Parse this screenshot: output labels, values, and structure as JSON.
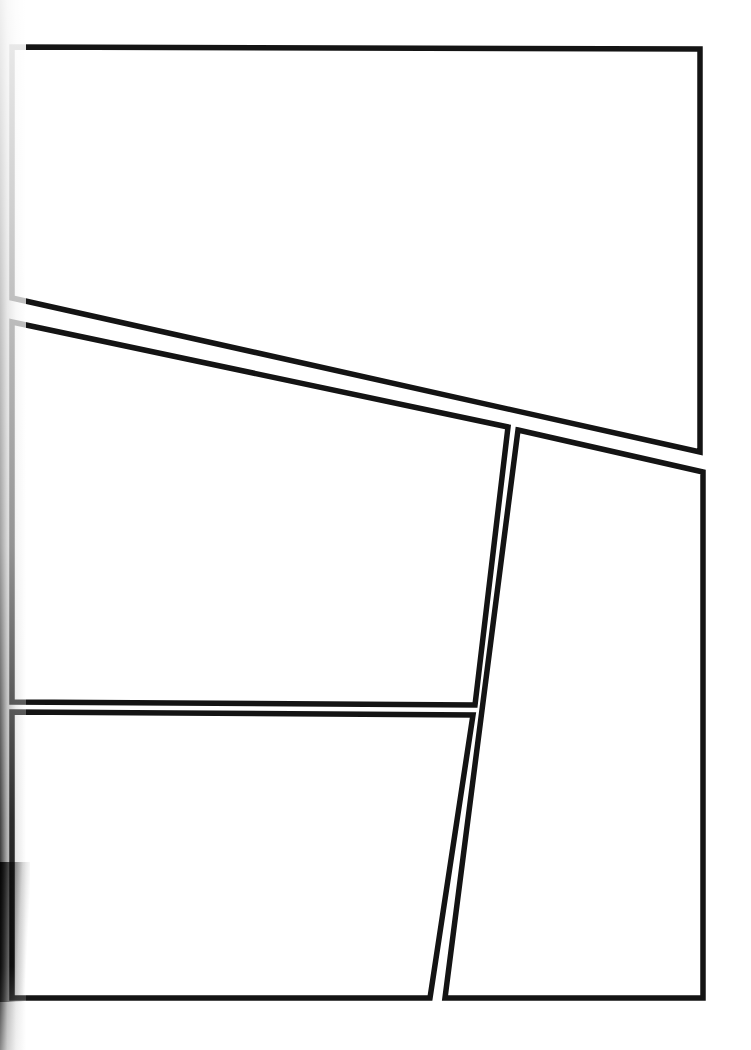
{
  "page": {
    "width": 751,
    "height": 1050,
    "background_color": "#ffffff",
    "ink_color": "#141414",
    "border_width_px": 5.5,
    "gutter_width_px": 9,
    "panel_count": 4,
    "content_note": "All panels are empty — no artwork, text, lettering or balloons are drawn."
  },
  "scan_artifacts": {
    "left_edge_shadow": {
      "name": "left-edge-scan-shadow",
      "description": "Dark vertical gradient band along the left margin, darkest toward the lower-left corner",
      "color": "#000000",
      "x": 0,
      "y": 0,
      "width": 26,
      "height": 1050
    },
    "lower_left_blotch": {
      "name": "lower-left-scan-blotch",
      "description": "Heavier black smudge near the bottom-left corner of the scan",
      "color": "#000000",
      "x": 0,
      "y": 820,
      "width": 34,
      "height": 230
    }
  },
  "panels": [
    {
      "id": "panel-1",
      "label": "Panel 1",
      "position": "top full-width",
      "shape": "quadrilateral",
      "fill": "#ffffff",
      "stroke": "#141414",
      "empty": true,
      "points": "12,47 700,49 700,452 12,298",
      "corners": [
        {
          "name": "top-left",
          "x": 12,
          "y": 47
        },
        {
          "name": "top-right",
          "x": 700,
          "y": 49
        },
        {
          "name": "bottom-right",
          "x": 700,
          "y": 452
        },
        {
          "name": "bottom-left",
          "x": 12,
          "y": 298
        }
      ]
    },
    {
      "id": "panel-2",
      "label": "Panel 2",
      "position": "middle left",
      "shape": "quadrilateral",
      "fill": "#ffffff",
      "stroke": "#141414",
      "empty": true,
      "points": "12,322 508,427 475,705 12,702",
      "corners": [
        {
          "name": "top-left",
          "x": 12,
          "y": 322
        },
        {
          "name": "top-right",
          "x": 508,
          "y": 427
        },
        {
          "name": "bottom-right",
          "x": 475,
          "y": 705
        },
        {
          "name": "bottom-left",
          "x": 12,
          "y": 702
        }
      ]
    },
    {
      "id": "panel-3",
      "label": "Panel 3",
      "position": "right tall",
      "shape": "quadrilateral",
      "fill": "#ffffff",
      "stroke": "#141414",
      "empty": true,
      "points": "518,430 703,472 703,998 445,998",
      "corners": [
        {
          "name": "top-left",
          "x": 518,
          "y": 430
        },
        {
          "name": "top-right",
          "x": 703,
          "y": 472
        },
        {
          "name": "bottom-right",
          "x": 703,
          "y": 998
        },
        {
          "name": "bottom-left",
          "x": 445,
          "y": 998
        }
      ]
    },
    {
      "id": "panel-4",
      "label": "Panel 4",
      "position": "bottom left",
      "shape": "quadrilateral",
      "fill": "#ffffff",
      "stroke": "#141414",
      "empty": true,
      "points": "12,712 473,715 430,998 12,998",
      "corners": [
        {
          "name": "top-left",
          "x": 12,
          "y": 712
        },
        {
          "name": "top-right",
          "x": 473,
          "y": 715
        },
        {
          "name": "bottom-right",
          "x": 430,
          "y": 998
        },
        {
          "name": "bottom-left",
          "x": 12,
          "y": 998
        }
      ]
    }
  ]
}
